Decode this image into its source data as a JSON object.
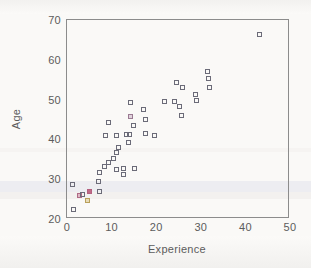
{
  "chart_data": {
    "type": "scatter",
    "title": "",
    "xlabel": "Experience",
    "ylabel": "Age",
    "xlim": [
      0,
      50
    ],
    "ylim": [
      20,
      70
    ],
    "xticks": [
      0,
      10,
      20,
      30,
      40,
      50
    ],
    "yticks": [
      20,
      30,
      40,
      50,
      60,
      70
    ],
    "grid": false,
    "legend": null,
    "marker_style": "open-square",
    "series": [
      {
        "name": "observations",
        "points": [
          {
            "x": 1.5,
            "y": 22.3,
            "color": "#6b6b78"
          },
          {
            "x": 1.3,
            "y": 28.6,
            "color": "#6b6b78"
          },
          {
            "x": 2.8,
            "y": 26.0,
            "color": "#b06a86"
          },
          {
            "x": 3.4,
            "y": 26.1,
            "color": "#6b6b78"
          },
          {
            "x": 4.6,
            "y": 24.6,
            "color": "#b9a05a"
          },
          {
            "x": 5.1,
            "y": 26.8,
            "color": "#b4607f"
          },
          {
            "x": 7.3,
            "y": 26.9,
            "color": "#6b6b78"
          },
          {
            "x": 7.0,
            "y": 29.3,
            "color": "#6b6b78"
          },
          {
            "x": 7.2,
            "y": 31.6,
            "color": "#6b6b78"
          },
          {
            "x": 8.3,
            "y": 33.2,
            "color": "#6b6b78"
          },
          {
            "x": 9.2,
            "y": 44.2,
            "color": "#6b6b78"
          },
          {
            "x": 8.6,
            "y": 41.0,
            "color": "#6b6b78"
          },
          {
            "x": 9.4,
            "y": 34.3,
            "color": "#6b6b78"
          },
          {
            "x": 10.5,
            "y": 35.3,
            "color": "#6b6b78"
          },
          {
            "x": 11.2,
            "y": 41.0,
            "color": "#6b6b78"
          },
          {
            "x": 11.1,
            "y": 36.6,
            "color": "#6b6b78"
          },
          {
            "x": 11.6,
            "y": 38.0,
            "color": "#6b6b78"
          },
          {
            "x": 11.0,
            "y": 32.5,
            "color": "#6b6b78"
          },
          {
            "x": 12.6,
            "y": 32.8,
            "color": "#6b6b78"
          },
          {
            "x": 12.7,
            "y": 31.2,
            "color": "#6b6b78"
          },
          {
            "x": 13.3,
            "y": 41.2,
            "color": "#6b6b78"
          },
          {
            "x": 14.0,
            "y": 41.3,
            "color": "#6b6b78"
          },
          {
            "x": 13.9,
            "y": 39.3,
            "color": "#6b6b78"
          },
          {
            "x": 14.2,
            "y": 45.8,
            "color": "#9a7a92"
          },
          {
            "x": 14.3,
            "y": 49.3,
            "color": "#6b6b78"
          },
          {
            "x": 15.0,
            "y": 43.4,
            "color": "#6b6b78"
          },
          {
            "x": 15.1,
            "y": 32.8,
            "color": "#6b6b78"
          },
          {
            "x": 17.1,
            "y": 47.6,
            "color": "#6b6b78"
          },
          {
            "x": 17.6,
            "y": 44.9,
            "color": "#6b6b78"
          },
          {
            "x": 17.5,
            "y": 41.5,
            "color": "#6b6b78"
          },
          {
            "x": 19.6,
            "y": 40.9,
            "color": "#6b6b78"
          },
          {
            "x": 21.9,
            "y": 49.4,
            "color": "#6b6b78"
          },
          {
            "x": 24.2,
            "y": 49.4,
            "color": "#6b6b78"
          },
          {
            "x": 24.5,
            "y": 54.2,
            "color": "#6b6b78"
          },
          {
            "x": 25.2,
            "y": 48.3,
            "color": "#6b6b78"
          },
          {
            "x": 25.6,
            "y": 45.9,
            "color": "#6b6b78"
          },
          {
            "x": 25.8,
            "y": 53.0,
            "color": "#6b6b78"
          },
          {
            "x": 28.8,
            "y": 51.4,
            "color": "#6b6b78"
          },
          {
            "x": 29.1,
            "y": 49.7,
            "color": "#6b6b78"
          },
          {
            "x": 31.6,
            "y": 57.0,
            "color": "#6b6b78"
          },
          {
            "x": 31.7,
            "y": 55.3,
            "color": "#6b6b78"
          },
          {
            "x": 31.9,
            "y": 53.0,
            "color": "#6b6b78"
          },
          {
            "x": 43.1,
            "y": 66.4,
            "color": "#6b6b78"
          }
        ]
      }
    ]
  }
}
